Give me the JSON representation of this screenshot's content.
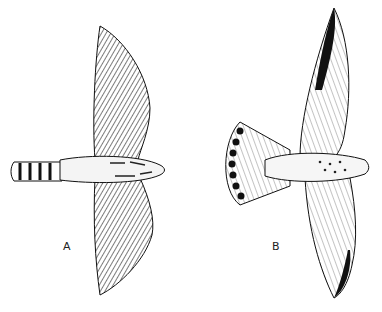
{
  "figure": {
    "birds": [
      {
        "label": "A",
        "description": "bird of prey in flight, underside view, long narrow barred tail, pointed dark-streaked wings"
      },
      {
        "label": "B",
        "description": "bird of prey in flight, underside view, fanned tail with dark spots along edge, pointed wings with dark tips"
      }
    ],
    "colors": {
      "ink": "#1a1a1a",
      "paper": "#ffffff"
    }
  }
}
